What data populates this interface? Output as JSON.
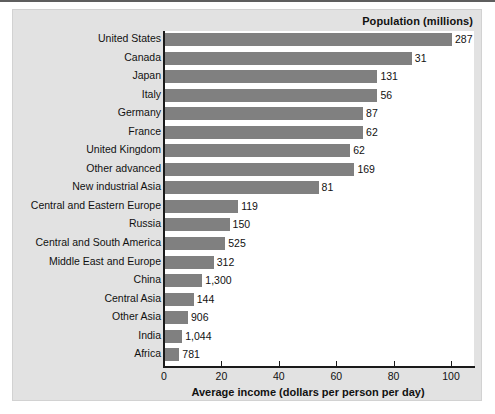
{
  "chart_data": {
    "type": "bar",
    "orientation": "horizontal",
    "title": "",
    "series_caption": "Population (millions)",
    "xlabel": "Average income (dollars per person per day)",
    "ylabel": "",
    "xlim": [
      0,
      108
    ],
    "xticks": [
      0,
      20,
      40,
      60,
      80,
      100
    ],
    "xtick_labels": [
      "0",
      "20",
      "40",
      "60",
      "80",
      "100"
    ],
    "grid": false,
    "legend": "none",
    "bar_color": "#808080",
    "categories": [
      "United States",
      "Canada",
      "Japan",
      "Italy",
      "Germany",
      "France",
      "United Kingdom",
      "Other advanced",
      "New industrial Asia",
      "Central and Eastern Europe",
      "Russia",
      "Central and South America",
      "Middle East and Europe",
      "China",
      "Central Asia",
      "Other Asia",
      "India",
      "Africa"
    ],
    "values": [
      100,
      86,
      74,
      74,
      69,
      69,
      64.5,
      66,
      53.5,
      25.5,
      22.5,
      21,
      17,
      13,
      10,
      8,
      6,
      5
    ],
    "point_labels": [
      "287",
      "31",
      "131",
      "56",
      "87",
      "62",
      "62",
      "169",
      "81",
      "119",
      "150",
      "525",
      "312",
      "1,300",
      "144",
      "906",
      "1,044",
      "781"
    ],
    "rows": [
      {
        "category": "United States",
        "value": 100,
        "label": "287"
      },
      {
        "category": "Canada",
        "value": 86,
        "label": "31"
      },
      {
        "category": "Japan",
        "value": 74,
        "label": "131"
      },
      {
        "category": "Italy",
        "value": 74,
        "label": "56"
      },
      {
        "category": "Germany",
        "value": 69,
        "label": "87"
      },
      {
        "category": "France",
        "value": 69,
        "label": "62"
      },
      {
        "category": "United Kingdom",
        "value": 64.5,
        "label": "62"
      },
      {
        "category": "Other advanced",
        "value": 66,
        "label": "169"
      },
      {
        "category": "New industrial Asia",
        "value": 53.5,
        "label": "81"
      },
      {
        "category": "Central and Eastern Europe",
        "value": 25.5,
        "label": "119"
      },
      {
        "category": "Russia",
        "value": 22.5,
        "label": "150"
      },
      {
        "category": "Central and South America",
        "value": 21,
        "label": "525"
      },
      {
        "category": "Middle East and Europe",
        "value": 17,
        "label": "312"
      },
      {
        "category": "China",
        "value": 13,
        "label": "1,300"
      },
      {
        "category": "Central Asia",
        "value": 10,
        "label": "144"
      },
      {
        "category": "Other Asia",
        "value": 8,
        "label": "906"
      },
      {
        "category": "India",
        "value": 6,
        "label": "1,044"
      },
      {
        "category": "Africa",
        "value": 5,
        "label": "781"
      }
    ]
  }
}
